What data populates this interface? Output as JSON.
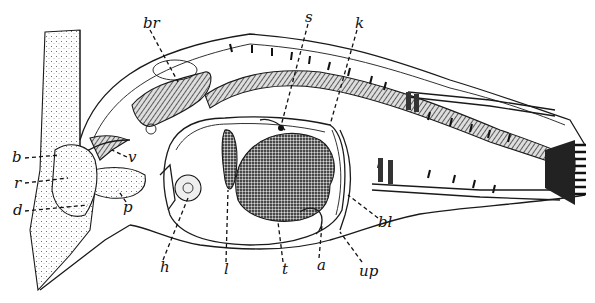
{
  "figure": {
    "type": "anatomical sagittal section line illustration",
    "background": "#ffffff",
    "ink": "#111111"
  },
  "labels": [
    {
      "id": "br",
      "text": "br",
      "x": 143,
      "y": 28
    },
    {
      "id": "s",
      "text": "s",
      "x": 305,
      "y": 22
    },
    {
      "id": "k",
      "text": "k",
      "x": 355,
      "y": 28
    },
    {
      "id": "b",
      "text": "b",
      "x": 12,
      "y": 162
    },
    {
      "id": "r",
      "text": "r",
      "x": 14,
      "y": 188
    },
    {
      "id": "d",
      "text": "d",
      "x": 13,
      "y": 215
    },
    {
      "id": "v",
      "text": "v",
      "x": 128,
      "y": 162
    },
    {
      "id": "p",
      "text": "p",
      "x": 123,
      "y": 212
    },
    {
      "id": "h",
      "text": "h",
      "x": 160,
      "y": 272
    },
    {
      "id": "l",
      "text": "l",
      "x": 224,
      "y": 274
    },
    {
      "id": "t",
      "text": "t",
      "x": 282,
      "y": 274
    },
    {
      "id": "a",
      "text": "a",
      "x": 317,
      "y": 270
    },
    {
      "id": "up",
      "text": "up",
      "x": 359,
      "y": 276
    },
    {
      "id": "bl",
      "text": "bl",
      "x": 378,
      "y": 227
    }
  ]
}
